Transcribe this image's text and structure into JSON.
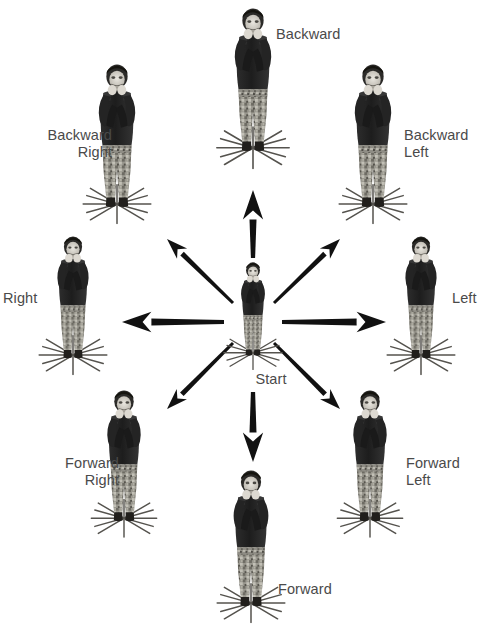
{
  "diagram": {
    "background_color": "#ffffff",
    "label_color": "#4a4a4a",
    "arrow_color": "#111111",
    "width": 489,
    "height": 627,
    "center": {
      "x": 253,
      "y": 322,
      "label": "Start"
    }
  },
  "labels": {
    "backward": "Backward",
    "backward_right": "Backward\nRight",
    "backward_left": "Backward\nLeft",
    "right": "Right",
    "left": "Left",
    "start": "Start",
    "forward_right": "Forward\nRight",
    "forward_left": "Forward\nLeft",
    "forward": "Forward"
  },
  "positions": [
    {
      "id": "center",
      "name": "start-figure",
      "label_key": "start",
      "label": "Start",
      "label_x": 236,
      "label_y": 371,
      "label_align": "center",
      "fig_x": 228,
      "fig_y": 262,
      "fig_w": 50,
      "fig_h": 95,
      "star": true,
      "scale": 1.0
    },
    {
      "id": "backward",
      "name": "backward-figure",
      "label_key": "backward",
      "label": "Backward",
      "label_x": 276,
      "label_y": 26,
      "label_align": "left",
      "fig_x": 222,
      "fig_y": 8,
      "fig_w": 62,
      "fig_h": 145,
      "star": true,
      "scale": 1.0
    },
    {
      "id": "backward_right",
      "name": "backward-right-figure",
      "label_key": "backward_right",
      "label": "Backward\nRight",
      "label_x": 17,
      "label_y": 127,
      "label_align": "right",
      "fig_x": 88,
      "fig_y": 61,
      "fig_w": 58,
      "fig_h": 148,
      "star": true,
      "scale": 1.0
    },
    {
      "id": "backward_left",
      "name": "backward-left-figure",
      "label_key": "backward_left",
      "label": "Backward\nLeft",
      "label_x": 404,
      "label_y": 127,
      "label_align": "left",
      "fig_x": 344,
      "fig_y": 61,
      "fig_w": 58,
      "fig_h": 148,
      "star": true,
      "scale": 1.0
    },
    {
      "id": "right",
      "name": "right-figure",
      "label_key": "right",
      "label": "Right",
      "label_x": 3,
      "label_y": 290,
      "label_align": "left",
      "fig_x": 44,
      "fig_y": 236,
      "fig_w": 58,
      "fig_h": 124,
      "star": true,
      "scale": 1.0
    },
    {
      "id": "left",
      "name": "left-figure",
      "label_key": "left",
      "label": "Left",
      "label_x": 452,
      "label_y": 290,
      "label_align": "left",
      "fig_x": 392,
      "fig_y": 236,
      "fig_w": 58,
      "fig_h": 124,
      "star": true,
      "scale": 1.0
    },
    {
      "id": "forward_right",
      "name": "forward-right-figure",
      "label_key": "forward_right",
      "label": "Forward\nRight",
      "label_x": 24,
      "label_y": 455,
      "label_align": "right",
      "fig_x": 96,
      "fig_y": 390,
      "fig_w": 56,
      "fig_h": 133,
      "star": true,
      "scale": 1.0
    },
    {
      "id": "forward_left",
      "name": "forward-left-figure",
      "label_key": "forward_left",
      "label": "Forward\nLeft",
      "label_x": 406,
      "label_y": 455,
      "label_align": "left",
      "fig_x": 342,
      "fig_y": 390,
      "fig_w": 56,
      "fig_h": 133,
      "star": true,
      "scale": 1.0
    },
    {
      "id": "forward",
      "name": "forward-figure",
      "label_key": "forward",
      "label": "Forward",
      "label_x": 278,
      "label_y": 581,
      "label_align": "left",
      "fig_x": 222,
      "fig_y": 470,
      "fig_w": 58,
      "fig_h": 138,
      "star": true,
      "scale": 1.0
    }
  ],
  "arrows": [
    {
      "id": "arrow-up",
      "direction": "backward",
      "x1": 253,
      "y1": 258,
      "x2": 253,
      "y2": 190,
      "weight": 7
    },
    {
      "id": "arrow-down",
      "direction": "forward",
      "x1": 253,
      "y1": 392,
      "x2": 253,
      "y2": 462,
      "weight": 7
    },
    {
      "id": "arrow-left",
      "direction": "right",
      "x1": 224,
      "y1": 322,
      "x2": 122,
      "y2": 322,
      "weight": 7
    },
    {
      "id": "arrow-right",
      "direction": "left",
      "x1": 282,
      "y1": 322,
      "x2": 386,
      "y2": 322,
      "weight": 7
    },
    {
      "id": "arrow-up-left",
      "direction": "backward-right",
      "x1": 233,
      "y1": 303,
      "x2": 167,
      "y2": 239,
      "weight": 5
    },
    {
      "id": "arrow-up-right",
      "direction": "backward-left",
      "x1": 274,
      "y1": 303,
      "x2": 340,
      "y2": 239,
      "weight": 5
    },
    {
      "id": "arrow-down-left",
      "direction": "forward-right",
      "x1": 233,
      "y1": 343,
      "x2": 167,
      "y2": 409,
      "weight": 5
    },
    {
      "id": "arrow-down-right",
      "direction": "forward-left",
      "x1": 274,
      "y1": 343,
      "x2": 340,
      "y2": 409,
      "weight": 5
    }
  ]
}
